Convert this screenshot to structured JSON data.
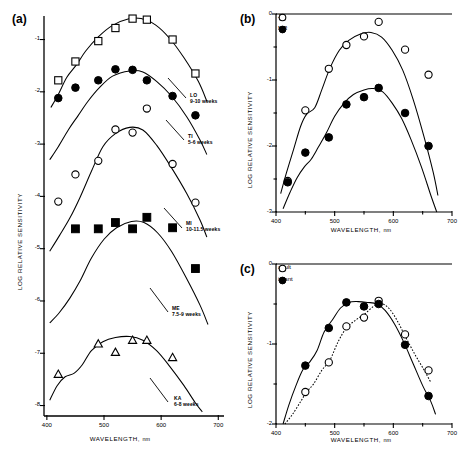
{
  "figure": {
    "background": "#ffffff",
    "ink": "#000000"
  },
  "panel_a": {
    "label": "(a)",
    "axes": {
      "xlabel": "WAVELENGTH,",
      "xunit": "nm",
      "ylabel": "LOG RELATIVE SENSITIVITY",
      "xticks": [
        "400",
        "500",
        "600",
        "700"
      ],
      "xtickvalues": [
        400,
        500,
        600,
        700
      ],
      "yticks": [
        "-1",
        "-2",
        "-3",
        "-4",
        "-5",
        "-6",
        "-7",
        "-8"
      ],
      "ytickvalues": [
        -1,
        -2,
        -3,
        -4,
        -5,
        -6,
        -7,
        -8
      ],
      "xlim": [
        395,
        710
      ],
      "ylim": [
        -8.2,
        -0.55
      ]
    },
    "series_labels": [
      {
        "name": "LO",
        "age": "9-10 weeks"
      },
      {
        "name": "TI",
        "age": "5-6 weeks"
      },
      {
        "name": "MI",
        "age": "10-11.5 weeks"
      },
      {
        "name": "ME",
        "age": "7.5-9 weeks"
      },
      {
        "name": "KA",
        "age": "6-8 weeks"
      }
    ]
  },
  "panel_b": {
    "label": "(b)",
    "axes": {
      "xlabel": "WAVELENGTH,",
      "xunit": "nm",
      "ylabel": "LOG RELATIVE SENSITIVITY",
      "xticks": [
        "400",
        "500",
        "600",
        "700"
      ],
      "xtickvalues": [
        400,
        500,
        600,
        700
      ],
      "yticks": [
        "0",
        "-1",
        "-2",
        "-3"
      ],
      "ytickvalues": [
        0,
        -1,
        -2,
        -3
      ],
      "xlim": [
        400,
        700
      ],
      "ylim": [
        -3,
        0
      ]
    },
    "legend": [
      {
        "label": "JV",
        "marker": "open-circle"
      },
      {
        "label": "MR",
        "marker": "filled-circle"
      }
    ]
  },
  "panel_c": {
    "label": "(c)",
    "axes": {
      "xlabel": "WAVELENGTH,",
      "xunit": "nm",
      "ylabel": "LOG RELATIVE SENSITIVITY",
      "xticks": [
        "400",
        "500",
        "600",
        "700"
      ],
      "xtickvalues": [
        400,
        500,
        600,
        700
      ],
      "yticks": [
        "0",
        "-1",
        "-2"
      ],
      "ytickvalues": [
        0,
        -1,
        -2
      ],
      "xlim": [
        400,
        700
      ],
      "ylim": [
        -2,
        0
      ]
    },
    "legend": [
      {
        "label": "adult",
        "marker": "open-circle"
      },
      {
        "label": "infant",
        "marker": "filled-circle"
      }
    ]
  },
  "chart_data": [
    {
      "type": "scatter",
      "panel": "a",
      "title": "",
      "xlabel": "WAVELENGTH, nm",
      "ylabel": "LOG RELATIVE SENSITIVITY",
      "xlim": [
        395,
        710
      ],
      "ylim": [
        -8.2,
        -0.55
      ],
      "grid": false,
      "legend_position": "inline-right",
      "series": [
        {
          "name": "LO",
          "annotation": "LO 9-10 weeks",
          "marker": "open-square",
          "x": [
            420,
            450,
            490,
            520,
            550,
            575,
            620,
            660
          ],
          "y": [
            -1.78,
            -1.42,
            -1.03,
            -0.78,
            -0.6,
            -0.62,
            -1.0,
            -1.65
          ]
        },
        {
          "name": "TI",
          "annotation": "TI 5-6 weeks",
          "marker": "filled-circle",
          "x": [
            420,
            450,
            490,
            520,
            550,
            575,
            620,
            660
          ],
          "y": [
            -2.12,
            -1.92,
            -1.78,
            -1.57,
            -1.58,
            -1.78,
            -2.08,
            -2.45
          ]
        },
        {
          "name": "MI",
          "annotation": "MI 10-11.5 weeks",
          "marker": "open-circle",
          "x": [
            420,
            450,
            490,
            520,
            550,
            575,
            620,
            660
          ],
          "y": [
            -4.1,
            -3.58,
            -3.32,
            -2.72,
            -2.78,
            -2.32,
            -3.38,
            -4.12
          ]
        },
        {
          "name": "ME",
          "annotation": "ME 7.5-9 weeks",
          "marker": "filled-square",
          "x": [
            450,
            490,
            520,
            550,
            575,
            620,
            660
          ],
          "y": [
            -4.62,
            -4.62,
            -4.5,
            -4.62,
            -4.4,
            -4.6,
            -5.38
          ]
        },
        {
          "name": "KA",
          "annotation": "KA 6-8 weeks",
          "marker": "open-triangle",
          "x": [
            420,
            490,
            520,
            550,
            575,
            620
          ],
          "y": [
            -7.4,
            -6.82,
            -6.98,
            -6.75,
            -6.75,
            -7.08
          ]
        }
      ]
    },
    {
      "type": "scatter",
      "panel": "b",
      "title": "",
      "xlabel": "WAVELENGTH, nm",
      "ylabel": "LOG RELATIVE SENSITIVITY",
      "xlim": [
        400,
        700
      ],
      "ylim": [
        -3,
        0
      ],
      "grid": false,
      "legend_position": "top-left",
      "series": [
        {
          "name": "JV",
          "marker": "open-circle",
          "x": [
            420,
            450,
            490,
            520,
            550,
            575,
            620,
            660
          ],
          "y": [
            -2.53,
            -1.46,
            -0.83,
            -0.47,
            -0.34,
            -0.12,
            -0.54,
            -0.92
          ]
        },
        {
          "name": "MR",
          "marker": "filled-circle",
          "x": [
            420,
            450,
            490,
            520,
            550,
            575,
            620,
            660
          ],
          "y": [
            -2.55,
            -2.1,
            -1.87,
            -1.37,
            -1.26,
            -1.12,
            -1.5,
            -2.0
          ]
        }
      ]
    },
    {
      "type": "scatter",
      "panel": "c",
      "title": "",
      "xlabel": "WAVELENGTH, nm",
      "ylabel": "LOG RELATIVE SENSITIVITY",
      "xlim": [
        400,
        700
      ],
      "ylim": [
        -2,
        0
      ],
      "grid": false,
      "legend_position": "top-left",
      "series": [
        {
          "name": "adult",
          "marker": "open-circle",
          "x": [
            450,
            490,
            520,
            550,
            575,
            620,
            660
          ],
          "y": [
            -1.6,
            -1.23,
            -0.78,
            -0.67,
            -0.46,
            -0.88,
            -1.33
          ]
        },
        {
          "name": "infant",
          "marker": "filled-circle",
          "x": [
            450,
            490,
            520,
            550,
            575,
            620,
            660
          ],
          "y": [
            -1.27,
            -0.8,
            -0.48,
            -0.53,
            -0.5,
            -1.01,
            -1.65
          ]
        }
      ]
    }
  ]
}
